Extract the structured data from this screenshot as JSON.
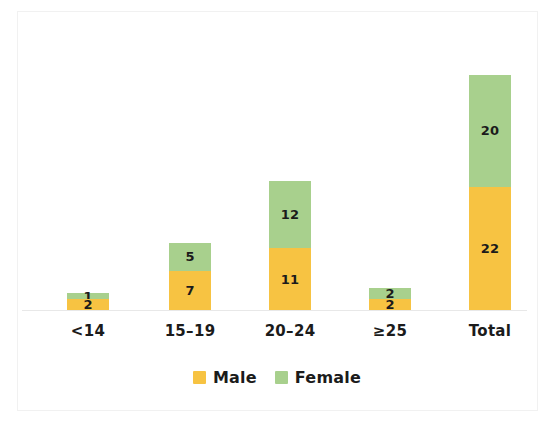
{
  "chart_data": {
    "type": "bar",
    "stacked": true,
    "title": "",
    "subtitle": "",
    "xlabel": "",
    "ylabel": "",
    "grid": false,
    "ylim": [
      0,
      42
    ],
    "axis_tick_labels": [],
    "legend_position": "bottom-center",
    "categories": [
      "<14",
      "15–19",
      "20–24",
      "≥25",
      "Total"
    ],
    "series": [
      {
        "name": "Male",
        "color": "#f7c342",
        "values": [
          2,
          7,
          11,
          2,
          22
        ]
      },
      {
        "name": "Female",
        "color": "#a8d08d",
        "values": [
          1,
          5,
          12,
          2,
          20
        ]
      }
    ],
    "bar_totals": [
      3,
      12,
      23,
      4,
      42
    ],
    "data_labels": {
      "male": [
        "2",
        "7",
        "11",
        "2",
        "22"
      ],
      "female": [
        "1",
        "5",
        "12",
        "2",
        "20"
      ]
    }
  },
  "legend": {
    "items": [
      {
        "label": "Male",
        "color": "#f7c342"
      },
      {
        "label": "Female",
        "color": "#a8d08d"
      }
    ]
  },
  "colors": {
    "male": "#f7c342",
    "female": "#a8d08d",
    "background": "#ffffff",
    "text": "#1b1b1b",
    "axis": "#e8e8e8",
    "frame": "#f1f1f1"
  }
}
